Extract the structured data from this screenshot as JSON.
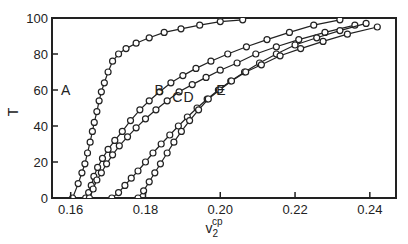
{
  "chart_data": {
    "type": "line",
    "title": "",
    "xlabel": "v2^cp",
    "xlabel_main": "v",
    "xlabel_sub": "2",
    "xlabel_sup": "cp",
    "ylabel": "T",
    "xlim": [
      0.155,
      0.247
    ],
    "ylim": [
      0,
      100
    ],
    "xticks": [
      0.16,
      0.18,
      0.2,
      0.22,
      0.24
    ],
    "xtick_labels": [
      "0.16",
      "0.18",
      "0.20",
      "0.22",
      "0.24"
    ],
    "yticks": [
      0,
      20,
      40,
      60,
      80,
      100
    ],
    "ytick_labels": [
      "0",
      "20",
      "40",
      "60",
      "80",
      "100"
    ],
    "grid": false,
    "legend": "inline labels",
    "markers": "open circles",
    "series": [
      {
        "name": "A",
        "label_pos": [
          0.1615,
          60
        ],
        "x": [
          0.1605,
          0.162,
          0.163,
          0.1638,
          0.1645,
          0.1652,
          0.1658,
          0.1663,
          0.167,
          0.1676,
          0.1682,
          0.169,
          0.17,
          0.1712,
          0.1728,
          0.1748,
          0.1775,
          0.181,
          0.185,
          0.1895,
          0.1945,
          0.2,
          0.206
        ],
        "y": [
          0,
          8,
          14,
          19,
          25,
          31,
          37,
          42,
          48,
          54,
          59,
          64,
          70,
          76,
          80,
          83,
          86,
          89,
          92,
          94,
          96,
          98,
          99
        ]
      },
      {
        "name": "B",
        "label_pos": [
          0.1865,
          60
        ],
        "x": [
          0.164,
          0.1648,
          0.1655,
          0.1662,
          0.1672,
          0.1685,
          0.17,
          0.1718,
          0.1738,
          0.176,
          0.1785,
          0.181,
          0.1838,
          0.1868,
          0.19,
          0.1935,
          0.1975,
          0.202,
          0.207,
          0.2125,
          0.2185,
          0.225,
          0.232
        ],
        "y": [
          0,
          3,
          7,
          12,
          17,
          22,
          27,
          32,
          37,
          43,
          49,
          54,
          59,
          64,
          68,
          72,
          76,
          80,
          84,
          88,
          92,
          96,
          99
        ]
      },
      {
        "name": "C",
        "label_pos": [
          0.1915,
          56
        ],
        "x": [
          0.165,
          0.166,
          0.167,
          0.1682,
          0.1696,
          0.1712,
          0.173,
          0.1752,
          0.1775,
          0.18,
          0.1828,
          0.1858,
          0.189,
          0.1925,
          0.1962,
          0.2,
          0.2045,
          0.2095,
          0.215,
          0.221,
          0.228,
          0.236
        ],
        "y": [
          0,
          5,
          10,
          14,
          19,
          24,
          29,
          34,
          39,
          44,
          49,
          54,
          59,
          63,
          67,
          71,
          75,
          80,
          84,
          88,
          92,
          96
        ]
      },
      {
        "name": "D",
        "label_pos": [
          0.1945,
          56
        ],
        "x": [
          0.171,
          0.1728,
          0.1745,
          0.1762,
          0.178,
          0.18,
          0.182,
          0.1842,
          0.1865,
          0.1888,
          0.1912,
          0.1938,
          0.1965,
          0.1995,
          0.2028,
          0.2065,
          0.2105,
          0.215,
          0.22,
          0.2258,
          0.232,
          0.239
        ],
        "y": [
          0,
          3,
          7,
          11,
          15,
          20,
          25,
          30,
          35,
          40,
          45,
          50,
          55,
          60,
          65,
          70,
          75,
          80,
          85,
          89,
          93,
          97
        ]
      },
      {
        "name": "E",
        "label_pos": [
          0.203,
          60
        ],
        "x": [
          0.178,
          0.1795,
          0.181,
          0.1825,
          0.184,
          0.1858,
          0.1876,
          0.1896,
          0.1918,
          0.1942,
          0.1968,
          0.1998,
          0.203,
          0.2068,
          0.211,
          0.216,
          0.2215,
          0.2275,
          0.234,
          0.242
        ],
        "y": [
          0,
          4,
          9,
          14,
          19,
          25,
          31,
          37,
          43,
          49,
          55,
          60,
          65,
          70,
          74,
          79,
          83,
          87,
          91,
          95
        ]
      }
    ]
  }
}
